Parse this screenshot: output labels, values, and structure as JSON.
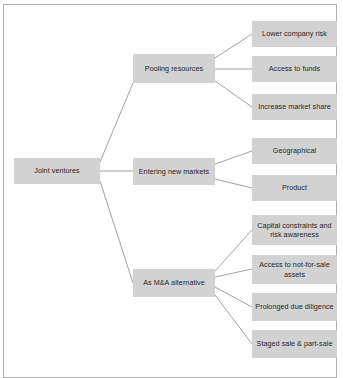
{
  "diagram": {
    "type": "tree",
    "box_fill": "#d2d2d2",
    "text_color": "#262626",
    "line_color": "#8a8a8a",
    "frame_color": "#b0b0b0",
    "root": {
      "id": "joint-ventures",
      "label": "Joint ventures"
    },
    "branches": [
      {
        "id": "pooling-resources",
        "label": "Pooling resources",
        "leaves": [
          {
            "id": "lower-company-risk",
            "label": "Lower company risk"
          },
          {
            "id": "access-to-funds",
            "label": "Access to funds"
          },
          {
            "id": "increase-market-share",
            "label": "Increase market share"
          }
        ]
      },
      {
        "id": "entering-new-markets",
        "label": "Entering new markets",
        "leaves": [
          {
            "id": "geographical",
            "label": "Geographical"
          },
          {
            "id": "product",
            "label": "Product"
          }
        ]
      },
      {
        "id": "as-ma-alternative",
        "label": "As M&A alternative",
        "leaves": [
          {
            "id": "capital-constraints",
            "label": "Capital constraints and risk awareness"
          },
          {
            "id": "not-for-sale-assets",
            "label": "Access to not-for-sale assets"
          },
          {
            "id": "prolonged-due-diligence",
            "label": "Prolonged due diligence"
          },
          {
            "id": "staged-sale-part-sale",
            "label": "Staged sale & part-sale"
          }
        ]
      }
    ]
  }
}
